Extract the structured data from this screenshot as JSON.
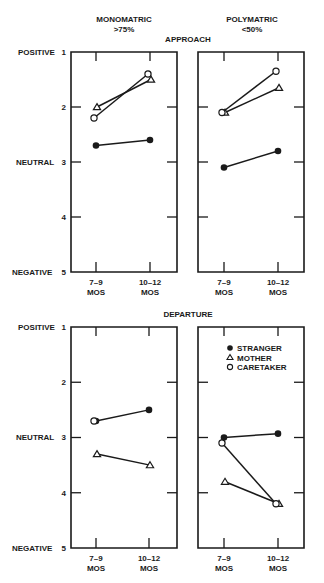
{
  "chart_data": [
    {
      "type": "line",
      "section": "APPROACH",
      "group": "MONOMATRIC",
      "group_sub": ">75%",
      "x": [
        "7–9 MOS",
        "10–12 MOS"
      ],
      "ylim": [
        1,
        5
      ],
      "yticks": [
        1,
        2,
        3,
        4,
        5
      ],
      "ytick_words": {
        "1": "POSITIVE",
        "3": "NEUTRAL",
        "5": "NEGATIVE"
      },
      "series": [
        {
          "name": "STRANGER",
          "marker": "filled-circle",
          "values": [
            2.7,
            2.6
          ],
          "connected": true
        },
        {
          "name": "MOTHER",
          "marker": "open-triangle",
          "values": [
            2.0,
            1.5
          ],
          "connected": true
        },
        {
          "name": "CARETAKER",
          "marker": "open-circle",
          "values": [
            2.2,
            1.4
          ],
          "connected": true
        }
      ]
    },
    {
      "type": "line",
      "section": "APPROACH",
      "group": "POLYMATRIC",
      "group_sub": "<50%",
      "x": [
        "7–9 MOS",
        "10–12 MOS"
      ],
      "ylim": [
        1,
        5
      ],
      "yticks": [
        1,
        2,
        3,
        4,
        5
      ],
      "series": [
        {
          "name": "STRANGER",
          "marker": "filled-circle",
          "values": [
            3.1,
            2.8
          ],
          "connected": true
        },
        {
          "name": "MOTHER",
          "marker": "open-triangle",
          "values": [
            2.1,
            1.65
          ],
          "connected": true
        },
        {
          "name": "CARETAKER",
          "marker": "open-circle",
          "values": [
            2.1,
            1.35
          ],
          "connected": true
        }
      ]
    },
    {
      "type": "line",
      "section": "DEPARTURE",
      "group": "MONOMATRIC",
      "x": [
        "7–9 MOS",
        "10–12 MOS"
      ],
      "ylim": [
        1,
        5
      ],
      "yticks": [
        1,
        2,
        3,
        4,
        5
      ],
      "ytick_words": {
        "1": "POSITIVE",
        "3": "NEUTRAL",
        "5": "NEGATIVE"
      },
      "series": [
        {
          "name": "STRANGER",
          "marker": "filled-circle",
          "values": [
            2.7,
            2.5
          ],
          "connected": true
        },
        {
          "name": "MOTHER",
          "marker": "open-triangle",
          "values": [
            3.3,
            3.5
          ],
          "connected": true
        },
        {
          "name": "CARETAKER",
          "marker": "open-circle",
          "values": [
            2.7,
            null
          ],
          "connected": false
        }
      ]
    },
    {
      "type": "line",
      "section": "DEPARTURE",
      "group": "POLYMATRIC",
      "x": [
        "7–9 MOS",
        "10–12 MOS"
      ],
      "ylim": [
        1,
        5
      ],
      "yticks": [
        1,
        2,
        3,
        4,
        5
      ],
      "legend": {
        "placement": "top",
        "entries": [
          {
            "name": "STRANGER",
            "marker": "filled-circle"
          },
          {
            "name": "MOTHER",
            "marker": "open-triangle"
          },
          {
            "name": "CARETAKER",
            "marker": "open-circle"
          }
        ]
      },
      "series": [
        {
          "name": "STRANGER",
          "marker": "filled-circle",
          "values": [
            3.0,
            2.93
          ],
          "connected": true
        },
        {
          "name": "MOTHER",
          "marker": "open-triangle",
          "values": [
            3.8,
            4.2
          ],
          "connected": true
        },
        {
          "name": "CARETAKER",
          "marker": "open-circle",
          "values": [
            3.1,
            4.2
          ],
          "connected": true
        }
      ]
    }
  ],
  "labels": {
    "mono_title": "MONOMATRIC",
    "mono_sub": ">75%",
    "poly_title": "POLYMATRIC",
    "poly_sub": "<50%",
    "approach": "APPROACH",
    "departure": "DEPARTURE",
    "positive": "POSITIVE",
    "neutral": "NEUTRAL",
    "negative": "NEGATIVE",
    "x1_top": "7–9",
    "x2_top": "10–12",
    "x_bottom": "MOS",
    "legend_stranger": "STRANGER",
    "legend_mother": "MOTHER",
    "legend_caretaker": "CARETAKER",
    "y1": "1",
    "y2": "2",
    "y3": "3",
    "y4": "4",
    "y5": "5"
  }
}
